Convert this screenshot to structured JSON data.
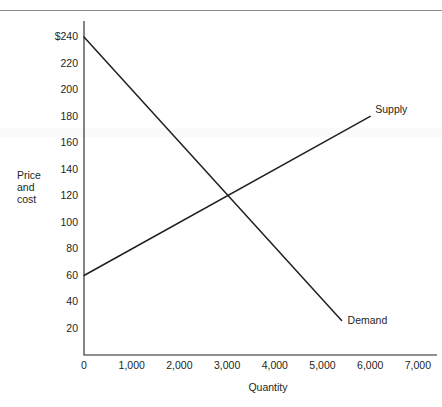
{
  "figure": {
    "clipped_header_text": "",
    "background_color": "#ffffff",
    "line_color": "#231f20",
    "axis_color": "#231f20"
  },
  "axes": {
    "y_title_line1": "Price",
    "y_title_line2": "and",
    "y_title_line3": "cost",
    "x_title": "Quantity"
  },
  "chart_data": {
    "type": "line",
    "title": "",
    "subtitle": "",
    "xlabel": "Quantity",
    "ylabel": "Price and cost",
    "xlim": [
      0,
      7400
    ],
    "ylim": [
      0,
      252
    ],
    "grid": false,
    "legend_position": "inline-right-of-line-end",
    "x_ticks": [
      0,
      1000,
      2000,
      3000,
      4000,
      5000,
      6000,
      7000
    ],
    "x_tick_labels": [
      "0",
      "1,000",
      "2,000",
      "3,000",
      "4,000",
      "5,000",
      "6,000",
      "7,000"
    ],
    "y_ticks": [
      20,
      40,
      60,
      80,
      100,
      120,
      140,
      160,
      180,
      200,
      220,
      240
    ],
    "y_tick_labels": [
      "20",
      "40",
      "60",
      "80",
      "100",
      "120",
      "140",
      "160",
      "180",
      "200",
      "220",
      "$240"
    ],
    "series": [
      {
        "name": "Supply",
        "label": "Supply",
        "color": "#231f20",
        "points": [
          [
            0,
            60
          ],
          [
            6000,
            180
          ]
        ],
        "slope_per_unit": 0.02,
        "intercept": 60
      },
      {
        "name": "Demand",
        "label": "Demand",
        "color": "#231f20",
        "points": [
          [
            0,
            240
          ],
          [
            5400,
            26
          ]
        ],
        "slope_per_unit": -0.03963,
        "intercept": 240
      }
    ],
    "annotations": [
      {
        "name": "equilibrium",
        "x": 3000,
        "y": 120,
        "text": ""
      }
    ]
  }
}
